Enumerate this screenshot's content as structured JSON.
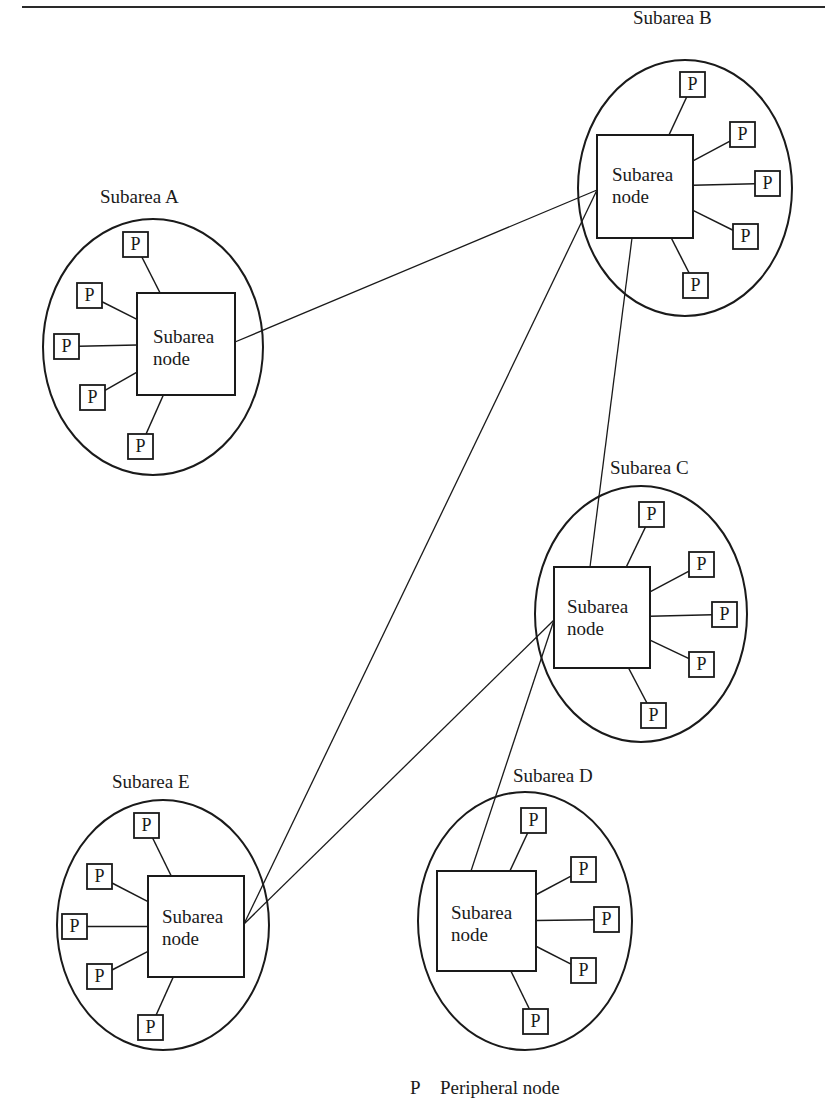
{
  "legend": {
    "symbol": "P",
    "text": "Peripheral node"
  },
  "node_label_line1": "Subarea",
  "node_label_line2": "node",
  "peripheral_label": "P",
  "subareas": [
    {
      "id": "A",
      "title": "Subarea A",
      "label_pos": [
        100,
        187
      ],
      "ellipse": [
        153,
        347,
        110,
        128
      ],
      "square": [
        137,
        293,
        98,
        102
      ],
      "node_text_pos": [
        153,
        326
      ],
      "peripherals": [
        [
          123,
          232
        ],
        [
          77,
          283
        ],
        [
          54,
          334
        ],
        [
          80,
          385
        ],
        [
          128,
          434
        ]
      ]
    },
    {
      "id": "B",
      "title": "Subarea B",
      "label_pos": [
        633,
        8
      ],
      "ellipse": [
        685,
        188,
        107,
        128
      ],
      "square": [
        597,
        135,
        96,
        103
      ],
      "node_text_pos": [
        612,
        164
      ],
      "peripherals": [
        [
          680,
          72
        ],
        [
          730,
          122
        ],
        [
          755,
          171
        ],
        [
          733,
          224
        ],
        [
          683,
          273
        ]
      ]
    },
    {
      "id": "C",
      "title": "Subarea C",
      "label_pos": [
        610,
        458
      ],
      "ellipse": [
        641,
        614,
        106,
        128
      ],
      "square": [
        554,
        567,
        96,
        101
      ],
      "node_text_pos": [
        567,
        596
      ],
      "peripherals": [
        [
          639,
          502
        ],
        [
          689,
          552
        ],
        [
          712,
          602
        ],
        [
          689,
          652
        ],
        [
          641,
          703
        ]
      ]
    },
    {
      "id": "D",
      "title": "Subarea D",
      "label_pos": [
        513,
        766
      ],
      "ellipse": [
        525,
        921,
        107,
        129
      ],
      "square": [
        437,
        871,
        99,
        100
      ],
      "node_text_pos": [
        451,
        902
      ],
      "peripherals": [
        [
          521,
          808
        ],
        [
          571,
          857
        ],
        [
          594,
          907
        ],
        [
          571,
          958
        ],
        [
          523,
          1009
        ]
      ]
    },
    {
      "id": "E",
      "title": "Subarea E",
      "label_pos": [
        112,
        772
      ],
      "ellipse": [
        163,
        925,
        106,
        125
      ],
      "square": [
        148,
        876,
        96,
        101
      ],
      "node_text_pos": [
        162,
        906
      ],
      "peripherals": [
        [
          134,
          813
        ],
        [
          87,
          864
        ],
        [
          62,
          914
        ],
        [
          87,
          964
        ],
        [
          138,
          1015
        ]
      ]
    }
  ],
  "links": [
    {
      "from": "A",
      "to": "B",
      "points": [
        235,
        342,
        597,
        190
      ]
    },
    {
      "from": "E",
      "to": "B",
      "points": [
        244,
        924,
        597,
        190
      ]
    },
    {
      "from": "B",
      "to": "C",
      "points": [
        632,
        238,
        590,
        567
      ]
    },
    {
      "from": "E",
      "to": "C",
      "points": [
        244,
        924,
        554,
        620
      ]
    },
    {
      "from": "D",
      "to": "C",
      "points": [
        471,
        871,
        554,
        620
      ]
    }
  ]
}
